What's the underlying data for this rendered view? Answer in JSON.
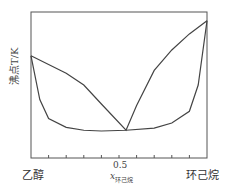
{
  "chart_data": {
    "type": "line",
    "title": "",
    "xlabel": "x环己烷",
    "xlabel_main": "x",
    "xlabel_sub": "环己烷",
    "ylabel": "沸点T/K",
    "xlim": [
      0,
      1
    ],
    "x_ticks": [
      0.1,
      0.2,
      0.3,
      0.4,
      0.5,
      0.6,
      0.7,
      0.8,
      0.9
    ],
    "x_tick_labels": {
      "0.5": "0.5"
    },
    "left_endpoint_label": "乙醇",
    "right_endpoint_label": "环己烷",
    "azeotrope": {
      "x": 0.54,
      "note": "minimum-boiling azeotrope"
    },
    "series": [
      {
        "name": "vapor (dew) curve",
        "x": [
          0.0,
          0.1,
          0.2,
          0.3,
          0.4,
          0.54,
          0.6,
          0.7,
          0.8,
          0.9,
          1.0
        ],
        "y_relative": [
          0.7,
          0.64,
          0.58,
          0.5,
          0.37,
          0.19,
          0.36,
          0.6,
          0.74,
          0.85,
          0.94
        ]
      },
      {
        "name": "liquid (bubble) curve",
        "x": [
          0.0,
          0.05,
          0.1,
          0.2,
          0.3,
          0.4,
          0.54,
          0.7,
          0.8,
          0.9,
          0.95,
          1.0
        ],
        "y_relative": [
          0.7,
          0.4,
          0.27,
          0.21,
          0.19,
          0.185,
          0.19,
          0.205,
          0.24,
          0.32,
          0.5,
          0.94
        ]
      }
    ],
    "grid": false,
    "legend": "none"
  },
  "labels": {
    "ylabel": "沸点T/K",
    "tick_05": "0.5",
    "xlabel_main": "x",
    "xlabel_sub": "环己烷",
    "left": "乙醇",
    "right": "环己烷"
  }
}
